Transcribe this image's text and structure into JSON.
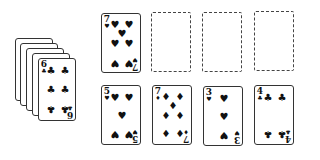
{
  "stock": {
    "count": 5,
    "top_card": {
      "rank": "6",
      "suit": "clubs",
      "symbol": "♣"
    }
  },
  "foundations": [
    {
      "card": {
        "rank": "7",
        "suit": "hearts",
        "symbol": "♥"
      }
    },
    {
      "empty": true
    },
    {
      "empty": true
    },
    {
      "empty": true
    }
  ],
  "tableau": [
    {
      "rank": "5",
      "suit": "hearts",
      "symbol": "♥"
    },
    {
      "rank": "7",
      "suit": "diamonds",
      "symbol": "♦"
    },
    {
      "rank": "3",
      "suit": "hearts",
      "symbol": "♥"
    },
    {
      "rank": "4",
      "suit": "clubs",
      "symbol": "♣"
    }
  ]
}
